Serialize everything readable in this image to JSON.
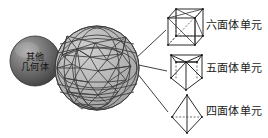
{
  "diagram": {
    "type": "mesh-element-decomposition",
    "background": "#ffffff",
    "colors": {
      "mesh_fill": "#b9b9b9",
      "mesh_edge": "#3a3a3a",
      "small_sphere_dark": "#4a4a4a",
      "small_sphere_light": "#9a9a9a",
      "line": "#2b2b2b",
      "text": "#1a1a1a",
      "dashed": "#555555"
    },
    "other_solid": {
      "name": "other-geometry-sphere",
      "label_line1": "其他",
      "label_line2": "几何体",
      "cx": 35,
      "cy": 61,
      "r": 25
    },
    "mesh_sphere": {
      "name": "triangulated-mesh-sphere",
      "cx": 97,
      "cy": 68,
      "r": 42
    },
    "elements": [
      {
        "id": "hexahedron",
        "icon": "cube-wireframe-icon",
        "label": "六面体单元",
        "label_x": 206,
        "label_y": 20,
        "shape_cx": 184,
        "shape_cy": 27
      },
      {
        "id": "pentahedron",
        "icon": "triangular-prism-wireframe-icon",
        "label": "五面体单元",
        "label_x": 206,
        "label_y": 63,
        "shape_cx": 186,
        "shape_cy": 71
      },
      {
        "id": "tetrahedron",
        "icon": "tetrahedron-wireframe-icon",
        "label": "四面体单元",
        "label_x": 206,
        "label_y": 106,
        "shape_cx": 187,
        "shape_cy": 114
      }
    ],
    "leader_lines": [
      {
        "name": "leader-line-hexahedron",
        "x1": 134,
        "y1": 60,
        "x2": 166,
        "y2": 30
      },
      {
        "name": "leader-line-pentahedron",
        "x1": 134,
        "y1": 64,
        "x2": 167,
        "y2": 71
      },
      {
        "name": "leader-line-tetrahedron",
        "x1": 133,
        "y1": 68,
        "x2": 168,
        "y2": 112
      }
    ]
  }
}
